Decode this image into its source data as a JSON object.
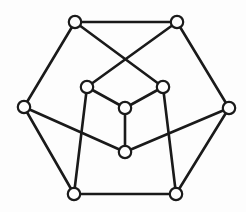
{
  "figure": {
    "background_color": "#fdfdfd",
    "edge_color": "#1a1a1a",
    "vertex_fill_color": "#fdfdfd",
    "vertex_stroke_color": "#1a1a1a",
    "edge_width": 2.6,
    "vertex_radius": 6.2,
    "vertex_count": 10,
    "edge_count": 15
  },
  "chart_data": {
    "type": "diagram",
    "diagram_kind": "graph",
    "title": "",
    "xlabel": "",
    "ylabel": "",
    "nodes": [
      {
        "id": "top-left",
        "label": "",
        "x": 75,
        "y": 22,
        "ring": "outer"
      },
      {
        "id": "top-right",
        "label": "",
        "x": 177,
        "y": 22,
        "ring": "outer"
      },
      {
        "id": "left",
        "label": "",
        "x": 24,
        "y": 107,
        "ring": "outer"
      },
      {
        "id": "right",
        "label": "",
        "x": 229,
        "y": 108,
        "ring": "outer"
      },
      {
        "id": "bottom-left",
        "label": "",
        "x": 74,
        "y": 194,
        "ring": "outer"
      },
      {
        "id": "bottom-right",
        "label": "",
        "x": 176,
        "y": 194,
        "ring": "outer"
      },
      {
        "id": "inner-left",
        "label": "",
        "x": 87,
        "y": 87,
        "ring": "inner"
      },
      {
        "id": "inner-right",
        "label": "",
        "x": 163,
        "y": 87,
        "ring": "inner"
      },
      {
        "id": "center",
        "label": "",
        "x": 125,
        "y": 108,
        "ring": "inner"
      },
      {
        "id": "lower-center",
        "label": "",
        "x": 125,
        "y": 152,
        "ring": "inner"
      }
    ],
    "edges": [
      {
        "from": "top-left",
        "to": "top-right"
      },
      {
        "from": "top-left",
        "to": "left"
      },
      {
        "from": "top-right",
        "to": "right"
      },
      {
        "from": "left",
        "to": "bottom-left"
      },
      {
        "from": "right",
        "to": "bottom-right"
      },
      {
        "from": "bottom-left",
        "to": "bottom-right"
      },
      {
        "from": "top-left",
        "to": "inner-right"
      },
      {
        "from": "top-right",
        "to": "inner-left"
      },
      {
        "from": "inner-left",
        "to": "center"
      },
      {
        "from": "inner-right",
        "to": "center"
      },
      {
        "from": "center",
        "to": "lower-center"
      },
      {
        "from": "inner-left",
        "to": "bottom-left"
      },
      {
        "from": "inner-right",
        "to": "bottom-right"
      },
      {
        "from": "left",
        "to": "lower-center"
      },
      {
        "from": "right",
        "to": "lower-center"
      }
    ]
  }
}
